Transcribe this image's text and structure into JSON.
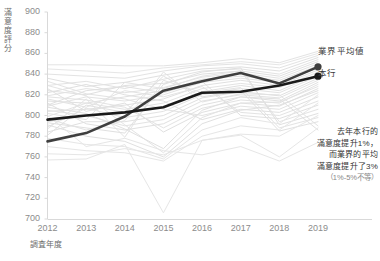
{
  "chart_data": {
    "type": "line",
    "title": "",
    "xlabel": "調査年度",
    "ylabel": "滿意度評分",
    "x": [
      2012,
      2013,
      2014,
      2015,
      2016,
      2017,
      2018,
      2019
    ],
    "xtick_labels": [
      "2012",
      "2013",
      "2014",
      "2015",
      "2016",
      "2017",
      "2018",
      "2019"
    ],
    "ytick_labels": [
      "700",
      "720",
      "740",
      "760",
      "780",
      "800",
      "820",
      "840",
      "860",
      "880",
      "900"
    ],
    "ytick_values": [
      700,
      720,
      740,
      760,
      780,
      800,
      820,
      840,
      860,
      880,
      900
    ],
    "ylim": [
      700,
      900
    ],
    "xlim": [
      2012,
      2019
    ],
    "grid": false,
    "legend_position": "right",
    "series": [
      {
        "name": "業界平均値",
        "highlight": true,
        "color": "#3f3f3f",
        "marker_end": true,
        "values": [
          775,
          783,
          799,
          824,
          833,
          841,
          831,
          847
        ]
      },
      {
        "name": "本行",
        "highlight": true,
        "color": "#1a1a1a",
        "marker_end": true,
        "values": [
          796,
          800,
          803,
          808,
          822,
          823,
          829,
          838
        ]
      },
      {
        "name": "background-1",
        "highlight": false,
        "color": "#e3e3e3",
        "values": [
          849,
          849,
          848,
          848,
          851,
          855,
          851,
          862
        ]
      },
      {
        "name": "background-2",
        "highlight": false,
        "color": "#e3e3e3",
        "values": [
          840,
          838,
          836,
          843,
          848,
          850,
          846,
          858
        ]
      },
      {
        "name": "background-3",
        "highlight": false,
        "color": "#e0e0e0",
        "values": [
          836,
          828,
          832,
          839,
          845,
          847,
          843,
          856
        ]
      },
      {
        "name": "background-4",
        "highlight": false,
        "color": "#e3e3e3",
        "values": [
          829,
          833,
          826,
          835,
          843,
          845,
          840,
          854
        ]
      },
      {
        "name": "background-5",
        "highlight": false,
        "color": "#e0e0e0",
        "values": [
          824,
          820,
          829,
          831,
          840,
          843,
          838,
          852
        ]
      },
      {
        "name": "background-6",
        "highlight": false,
        "color": "#e3e3e3",
        "values": [
          819,
          826,
          822,
          827,
          837,
          841,
          836,
          850
        ]
      },
      {
        "name": "background-7",
        "highlight": false,
        "color": "#e0e0e0",
        "values": [
          814,
          812,
          818,
          824,
          835,
          838,
          834,
          848
        ]
      },
      {
        "name": "background-8",
        "highlight": false,
        "color": "#e3e3e3",
        "values": [
          809,
          818,
          814,
          820,
          832,
          836,
          832,
          846
        ]
      },
      {
        "name": "background-9",
        "highlight": false,
        "color": "#e0e0e0",
        "values": [
          804,
          806,
          810,
          816,
          829,
          834,
          829,
          844
        ]
      },
      {
        "name": "background-10",
        "highlight": false,
        "color": "#e3e3e3",
        "values": [
          799,
          812,
          806,
          812,
          826,
          831,
          827,
          842
        ]
      },
      {
        "name": "background-11",
        "highlight": false,
        "color": "#e0e0e0",
        "values": [
          794,
          800,
          802,
          808,
          823,
          829,
          824,
          840
        ]
      },
      {
        "name": "background-12",
        "highlight": false,
        "color": "#e3e3e3",
        "values": [
          789,
          807,
          798,
          804,
          820,
          826,
          822,
          838
        ]
      },
      {
        "name": "background-13",
        "highlight": false,
        "color": "#e0e0e0",
        "values": [
          784,
          794,
          794,
          800,
          817,
          823,
          819,
          836
        ]
      },
      {
        "name": "background-14",
        "highlight": false,
        "color": "#e3e3e3",
        "values": [
          805,
          800,
          790,
          796,
          814,
          820,
          817,
          834
        ]
      },
      {
        "name": "background-15",
        "highlight": false,
        "color": "#e0e0e0",
        "values": [
          812,
          792,
          786,
          792,
          810,
          818,
          814,
          832
        ]
      },
      {
        "name": "background-16",
        "highlight": false,
        "color": "#e3e3e3",
        "values": [
          818,
          815,
          808,
          788,
          807,
          815,
          812,
          830
        ]
      },
      {
        "name": "background-17",
        "highlight": false,
        "color": "#e0e0e0",
        "values": [
          826,
          804,
          812,
          784,
          803,
          812,
          809,
          826
        ]
      },
      {
        "name": "background-18",
        "highlight": false,
        "color": "#e3e3e3",
        "values": [
          833,
          821,
          816,
          806,
          800,
          809,
          806,
          822
        ]
      },
      {
        "name": "background-19",
        "highlight": false,
        "color": "#e0e0e0",
        "values": [
          822,
          830,
          820,
          814,
          796,
          806,
          803,
          818
        ]
      },
      {
        "name": "background-20",
        "highlight": false,
        "color": "#e3e3e3",
        "values": [
          816,
          808,
          824,
          818,
          828,
          803,
          800,
          814
        ]
      },
      {
        "name": "background-21",
        "highlight": false,
        "color": "#e0e0e0",
        "values": [
          810,
          824,
          828,
          822,
          833,
          800,
          797,
          810
        ]
      },
      {
        "name": "background-22",
        "highlight": false,
        "color": "#e3e3e3",
        "values": [
          802,
          796,
          832,
          826,
          838,
          843,
          794,
          806
        ]
      },
      {
        "name": "background-23",
        "highlight": false,
        "color": "#e0e0e0",
        "values": [
          793,
          788,
          783,
          830,
          842,
          846,
          791,
          802
        ]
      },
      {
        "name": "background-24",
        "highlight": false,
        "color": "#e3e3e3",
        "values": [
          787,
          816,
          779,
          834,
          822,
          827,
          788,
          798
        ]
      },
      {
        "name": "background-25",
        "highlight": false,
        "color": "#e0e0e0",
        "values": [
          781,
          810,
          803,
          838,
          818,
          824,
          785,
          794
        ]
      },
      {
        "name": "background-26",
        "highlight": false,
        "color": "#e3e3e3",
        "values": [
          797,
          786,
          795,
          842,
          813,
          821,
          820,
          790
        ]
      },
      {
        "name": "background-27",
        "highlight": false,
        "color": "#e0e0e0",
        "values": [
          808,
          802,
          787,
          768,
          805,
          818,
          816,
          786
        ]
      },
      {
        "name": "background-28",
        "highlight": false,
        "color": "#e3e3e3",
        "values": [
          829,
          819,
          791,
          764,
          798,
          812,
          813,
          828
        ]
      },
      {
        "name": "background-29",
        "highlight": false,
        "color": "#e0e0e0",
        "values": [
          791,
          780,
          775,
          760,
          792,
          805,
          810,
          824
        ]
      },
      {
        "name": "background-30",
        "highlight": false,
        "color": "#e6e6e6",
        "values": [
          778,
          772,
          770,
          758,
          786,
          798,
          792,
          820
        ]
      },
      {
        "name": "background-31",
        "highlight": false,
        "color": "#e6e6e6",
        "values": [
          770,
          766,
          764,
          756,
          780,
          790,
          786,
          812
        ]
      },
      {
        "name": "background-32",
        "highlight": false,
        "color": "#e6e6e6",
        "values": [
          763,
          762,
          768,
          762,
          776,
          782,
          780,
          800
        ]
      },
      {
        "name": "background-33",
        "highlight": false,
        "color": "#e6e6e6",
        "values": [
          757,
          758,
          772,
          706,
          776,
          781,
          760,
          788
        ]
      },
      {
        "name": "background-34",
        "highlight": false,
        "color": "#e6e6e6",
        "values": [
          800,
          770,
          778,
          766,
          762,
          770,
          756,
          774
        ]
      },
      {
        "name": "background-35",
        "highlight": false,
        "color": "#e6e6e6",
        "values": [
          845,
          843,
          841,
          846,
          849,
          852,
          849,
          860
        ]
      }
    ]
  },
  "legend": {
    "items": [
      {
        "label": "業界平均値",
        "color": "#3f3f3f"
      },
      {
        "label": "本行",
        "color": "#1a1a1a"
      }
    ]
  },
  "annotation": {
    "lines": [
      "去年本行的",
      "滿意度提升1%，",
      "而業界的平均",
      "滿意度提升了3%"
    ],
    "sub": "（1%-5%不等）"
  }
}
